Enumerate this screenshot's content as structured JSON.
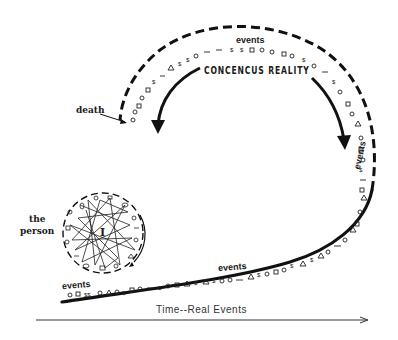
{
  "diagram": {
    "title": "CONCENCUS REALITY",
    "labels": {
      "events_top": "events",
      "events_right": "events",
      "events_mid": "events",
      "events_left": "events",
      "death": "death",
      "person_line1": "the",
      "person_line2": "person",
      "axis": "Time--Real Events"
    },
    "center_glyph": "I",
    "colors": {
      "ink": "#111111",
      "background": "#ffffff"
    }
  }
}
